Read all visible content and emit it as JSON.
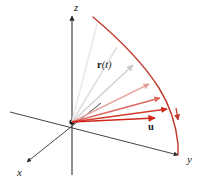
{
  "figure": {
    "background_color": "#ffffff",
    "width": 200,
    "height": 181
  },
  "axes": {
    "origin": {
      "x": 72,
      "y": 122
    },
    "color": "#2b2b2b",
    "items": [
      {
        "name": "z-axis",
        "label": "z",
        "label_x": 74,
        "label_y": 11,
        "from": {
          "x": 72,
          "y": 175
        },
        "to": {
          "x": 72,
          "y": 14
        },
        "arrow": true
      },
      {
        "name": "y-axis",
        "label": "y",
        "label_x": 187,
        "label_y": 163,
        "from": {
          "x": 10,
          "y": 112
        },
        "to": {
          "x": 180,
          "y": 156
        },
        "arrow": true
      },
      {
        "name": "x-axis",
        "label": "x",
        "label_x": 17,
        "label_y": 176,
        "from": {
          "x": 101,
          "y": 103
        },
        "to": {
          "x": 26,
          "y": 163
        },
        "arrow": true
      }
    ]
  },
  "curve": {
    "name": "trajectory",
    "label": "r(t)",
    "label_bold_part": "r",
    "label_paren_open": "(",
    "label_italic_part": "t",
    "label_paren_close": ")",
    "label_x": 97,
    "label_y": 67,
    "color": "#c0392b",
    "stroke_width": 1.4,
    "path": "M 93,17 C 118,38 143,63 160,89 C 170,105 176,125 178,145 L 179,155"
  },
  "curve_arrow": {
    "name": "trajectory-direction-arrow",
    "x": 177,
    "y": 121,
    "color": "#c0392b"
  },
  "vector_u": {
    "name": "unit-vector-u",
    "label": "u",
    "label_x": 149,
    "label_y": 129,
    "color": "#d0281c"
  },
  "fan": {
    "description": "Family of position vectors from origin fanning out to the curve, fading from light gray to red",
    "origin": {
      "x": 72,
      "y": 122
    },
    "rays": [
      {
        "name": "ray-1",
        "tip_x": 97,
        "tip_y": 24,
        "color": "#e9e9ea",
        "width": 1.5,
        "arrow": false
      },
      {
        "name": "ray-2",
        "tip_x": 117,
        "tip_y": 47,
        "color": "#e0dedf",
        "width": 1.5,
        "arrow": false
      },
      {
        "name": "ray-3",
        "tip_x": 136,
        "tip_y": 67,
        "color": "#d3d0d2",
        "width": 1.5,
        "arrow": true
      },
      {
        "name": "ray-4",
        "tip_x": 152,
        "tip_y": 85,
        "color": "#e8a9a4",
        "width": 1.4,
        "arrow": true
      },
      {
        "name": "ray-5",
        "tip_x": 163,
        "tip_y": 99,
        "color": "#dc6a60",
        "width": 1.4,
        "arrow": true
      },
      {
        "name": "ray-6",
        "tip_x": 170,
        "tip_y": 110,
        "color": "#d13c2e",
        "width": 1.4,
        "arrow": true
      },
      {
        "name": "ray-7",
        "tip_x": 158,
        "tip_y": 118,
        "color": "#d0281c",
        "width": 1.5,
        "arrow": true
      }
    ]
  }
}
